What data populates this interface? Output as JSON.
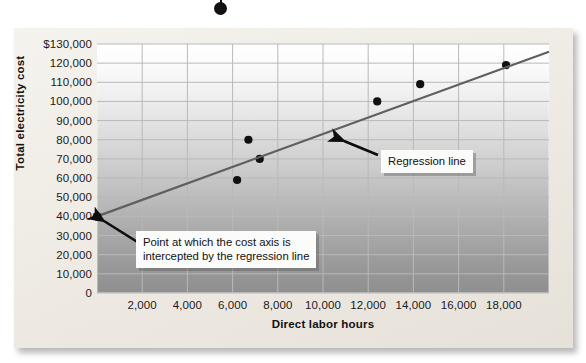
{
  "figure": {
    "artifact_dot_name": "page-artifact-dot"
  },
  "axes": {
    "y_title": "Total electricity cost",
    "x_title": "Direct labor hours",
    "y_ticks": [
      "$130,000",
      "120,000",
      "110,000",
      "100,000",
      "90,000",
      "80,000",
      "70,000",
      "60,000",
      "50,000",
      "40,000",
      "30,000",
      "20,000",
      "10,000",
      "0"
    ],
    "x_ticks": [
      "2,000",
      "4,000",
      "6,000",
      "8,000",
      "10,000",
      "12,000",
      "14,000",
      "16,000",
      "18,000"
    ]
  },
  "annotations": {
    "regression": {
      "text": "Regression line"
    },
    "intercept": {
      "line1": "Point at which the cost axis is",
      "line2": "intercepted by the regression line"
    }
  },
  "colors": {
    "point": "#101010",
    "regression_line": "#5f5f5f",
    "gridline": "#b9b9b9",
    "panel_background": "#efece6",
    "callout_background": "#fbfbfa"
  },
  "chart_data": {
    "type": "scatter",
    "title": "",
    "subtitle": "",
    "xlabel": "Direct labor hours",
    "ylabel": "Total electricity cost",
    "xlim": [
      0,
      20000
    ],
    "ylim": [
      0,
      130000
    ],
    "x_tick_values": [
      2000,
      4000,
      6000,
      8000,
      10000,
      12000,
      14000,
      16000,
      18000
    ],
    "y_tick_values": [
      0,
      10000,
      20000,
      30000,
      40000,
      50000,
      60000,
      70000,
      80000,
      90000,
      100000,
      110000,
      120000,
      130000
    ],
    "grid": true,
    "legend": "none",
    "series": [
      {
        "name": "Observed cost points",
        "type": "scatter",
        "points": [
          {
            "x": 6200,
            "y": 59000
          },
          {
            "x": 6700,
            "y": 80000
          },
          {
            "x": 7200,
            "y": 70000
          },
          {
            "x": 12400,
            "y": 100000
          },
          {
            "x": 14300,
            "y": 109000
          },
          {
            "x": 18100,
            "y": 119000
          }
        ]
      },
      {
        "name": "Regression line",
        "type": "line",
        "intercept": 40000,
        "slope": 4.3,
        "endpoints": [
          {
            "x": 0,
            "y": 40000
          },
          {
            "x": 20000,
            "y": 126000
          }
        ]
      }
    ],
    "annotations": [
      {
        "name": "regression-line-callout",
        "text": "Regression line",
        "points_to": {
          "x": 10100,
          "y": 83000
        }
      },
      {
        "name": "intercept-callout",
        "text": "Point at which the cost axis is intercepted by the regression line",
        "points_to": {
          "x": 0,
          "y": 40000
        }
      }
    ]
  }
}
